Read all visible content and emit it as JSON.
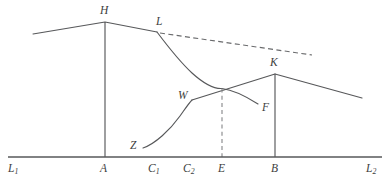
{
  "figure": {
    "type": "line-diagram",
    "background_color": "#ffffff",
    "stroke_color": "#57585a",
    "baseline": {
      "label_left": "L",
      "label_left_sub": "1",
      "label_right": "L",
      "label_right_sub": "2",
      "y": 157,
      "x_start": 8,
      "x_end": 382
    },
    "axis_labels": [
      {
        "name": "axis-label-L1",
        "text": "L",
        "sub": "1",
        "x": 8,
        "y": 163
      },
      {
        "name": "axis-label-A",
        "text": "A",
        "sub": "",
        "x": 100,
        "y": 163
      },
      {
        "name": "axis-label-C1",
        "text": "C",
        "sub": "1",
        "x": 148,
        "y": 163
      },
      {
        "name": "axis-label-C2",
        "text": "C",
        "sub": "2",
        "x": 183,
        "y": 163
      },
      {
        "name": "axis-label-E",
        "text": "E",
        "sub": "",
        "x": 218,
        "y": 163
      },
      {
        "name": "axis-label-B",
        "text": "B",
        "sub": "",
        "x": 271,
        "y": 163
      },
      {
        "name": "axis-label-L2",
        "text": "L",
        "sub": "2",
        "x": 366,
        "y": 163
      }
    ],
    "point_labels": [
      {
        "name": "point-label-H",
        "text": "H",
        "x": 100,
        "y": 5
      },
      {
        "name": "point-label-L",
        "text": "L",
        "x": 156,
        "y": 16
      },
      {
        "name": "point-label-K",
        "text": "K",
        "x": 270,
        "y": 57
      },
      {
        "name": "point-label-W",
        "text": "W",
        "x": 178,
        "y": 90
      },
      {
        "name": "point-label-Z",
        "text": "Z",
        "x": 130,
        "y": 140
      },
      {
        "name": "point-label-F",
        "text": "F",
        "x": 262,
        "y": 102
      }
    ],
    "paths": {
      "h_curve": "M 33 34 L 105 22 L 157 32",
      "l_descending_curve": "M 157 32 C 166 44 178 60 192 73 C 203 83 213 89 222 88.5 C 234 90 247 97 258 104",
      "dashed_trend": "M 160 33 L 312 55",
      "wk_rising": "M 192 100 L 275 74",
      "k_descending": "M 275 74 L 362 98",
      "z_curve": "M 143 148 C 155 144 170 130 180 116 C 185 109 189 103 192 100",
      "vert_a": "M 105 22 L 105 157",
      "vert_b": "M 275 74 L 275 157",
      "dashed_vert_e": "M 222 88.5 L 222 157"
    }
  }
}
